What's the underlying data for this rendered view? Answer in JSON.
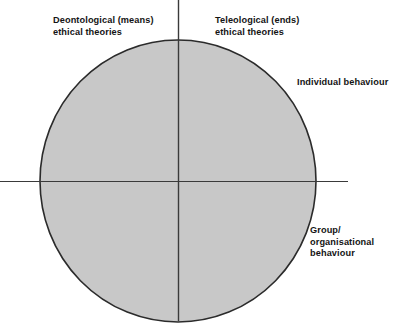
{
  "diagram": {
    "type": "quadrant-circle",
    "background_color": "#ffffff",
    "circle": {
      "fill_color": "#c8c8c8",
      "stroke_color": "#2b2b2b",
      "center_x": 178,
      "center_y": 181,
      "radius_x": 138,
      "radius_y": 141
    },
    "axes": {
      "color": "#3a3a3a",
      "vertical": {
        "x": 178,
        "y1": 0,
        "y2": 321
      },
      "horizontal": {
        "y": 181,
        "x1": 0,
        "x2": 348
      }
    },
    "labels": {
      "top_left": "Deontological (means)\nethical theories",
      "top_right": "Teleological (ends)\nethical theories",
      "right_upper": "Individual behaviour",
      "right_lower": "Group/\norganisational\nbehaviour"
    }
  }
}
